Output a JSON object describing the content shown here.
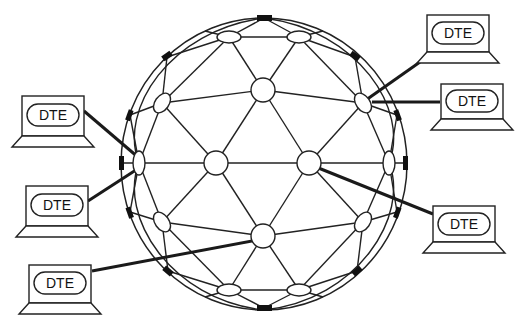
{
  "diagram": {
    "title": "",
    "type": "geodesic packet-switching network with terminals",
    "network_node_count": 16,
    "terminals": [
      {
        "id": "dte-1",
        "label": "DTE",
        "position": "upper-left"
      },
      {
        "id": "dte-2",
        "label": "DTE",
        "position": "middle-left"
      },
      {
        "id": "dte-3",
        "label": "DTE",
        "position": "bottom-left"
      },
      {
        "id": "dte-4",
        "label": "DTE",
        "position": "top-right"
      },
      {
        "id": "dte-5",
        "label": "DTE",
        "position": "upper-right"
      },
      {
        "id": "dte-6",
        "label": "DTE",
        "position": "lower-right"
      }
    ],
    "colors": {
      "line": "#222222",
      "port": "#111111",
      "background": "#ffffff"
    }
  }
}
